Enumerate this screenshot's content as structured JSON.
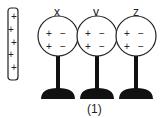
{
  "diagram": {
    "rod": {
      "label": "charged-rod",
      "charges": [
        "+",
        "+",
        "+",
        "+",
        "+"
      ]
    },
    "spheres": [
      {
        "name": "x",
        "charges_left": [
          "+",
          "+"
        ],
        "charges_right": [
          "−",
          "−"
        ]
      },
      {
        "name": "y",
        "charges_left": [
          "+",
          "+"
        ],
        "charges_right": [
          "−",
          "−"
        ]
      },
      {
        "name": "z",
        "charges_left": [
          "+",
          "+"
        ],
        "charges_right": [
          "−",
          "−"
        ]
      }
    ],
    "caption": "(1)"
  }
}
